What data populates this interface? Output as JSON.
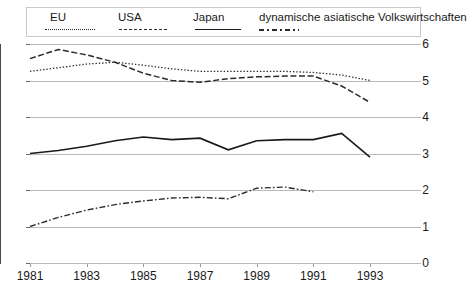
{
  "chart_data": {
    "type": "line",
    "title": "",
    "subtitle": "",
    "xlabel": "",
    "ylabel": "",
    "xlim": [
      1981,
      1993
    ],
    "ylim": [
      0,
      6
    ],
    "grid": true,
    "legend_position": "top",
    "x": [
      1981,
      1982,
      1983,
      1984,
      1985,
      1986,
      1987,
      1988,
      1989,
      1990,
      1991,
      1992,
      1993
    ],
    "x_tick_labels": [
      "1981",
      "1983",
      "1985",
      "1987",
      "1989",
      "1991",
      "1993"
    ],
    "x_tick_values": [
      1981,
      1983,
      1985,
      1987,
      1989,
      1991,
      1993
    ],
    "y_tick_labels": [
      "0",
      "1",
      "2",
      "3",
      "4",
      "5",
      "6"
    ],
    "y_tick_values": [
      0,
      1,
      2,
      3,
      4,
      5,
      6
    ],
    "series": [
      {
        "name": "EU",
        "line_style": "dotted",
        "x": [
          1981,
          1982,
          1983,
          1984,
          1985,
          1986,
          1987,
          1988,
          1989,
          1990,
          1991,
          1992,
          1993
        ],
        "values": [
          5.25,
          5.35,
          5.45,
          5.5,
          5.42,
          5.32,
          5.25,
          5.25,
          5.25,
          5.25,
          5.22,
          5.15,
          5.0
        ]
      },
      {
        "name": "USA",
        "line_style": "dashed",
        "x": [
          1981,
          1982,
          1983,
          1984,
          1985,
          1986,
          1987,
          1988,
          1989,
          1990,
          1991,
          1992,
          1993
        ],
        "values": [
          5.6,
          5.85,
          5.7,
          5.5,
          5.2,
          5.0,
          4.95,
          5.05,
          5.1,
          5.12,
          5.12,
          4.85,
          4.4
        ]
      },
      {
        "name": "Japan",
        "line_style": "solid",
        "x": [
          1981,
          1982,
          1983,
          1984,
          1985,
          1986,
          1987,
          1988,
          1989,
          1990,
          1991,
          1992,
          1993
        ],
        "values": [
          3.0,
          3.08,
          3.2,
          3.35,
          3.45,
          3.38,
          3.42,
          3.1,
          3.35,
          3.38,
          3.38,
          3.55,
          2.9
        ]
      },
      {
        "name": "dynamische asiatische Volkswirtschaften",
        "line_style": "dash-dot",
        "x": [
          1981,
          1982,
          1983,
          1984,
          1985,
          1986,
          1987,
          1988,
          1989,
          1990,
          1991
        ],
        "values": [
          1.0,
          1.25,
          1.45,
          1.6,
          1.7,
          1.78,
          1.8,
          1.76,
          2.05,
          2.08,
          1.95
        ]
      }
    ]
  },
  "legend": {
    "items": [
      {
        "label": "EU",
        "style": "dotted"
      },
      {
        "label": "USA",
        "style": "dashed"
      },
      {
        "label": "Japan",
        "style": "solid"
      },
      {
        "label": "dynamische asiatische Volkswirtschaften",
        "style": "dash-dot"
      }
    ]
  },
  "axes": {
    "y_labels": [
      "6",
      "5",
      "4",
      "3",
      "2",
      "1",
      "0"
    ],
    "x_labels": [
      "1981",
      "1983",
      "1985",
      "1987",
      "1989",
      "1991",
      "1993"
    ]
  }
}
